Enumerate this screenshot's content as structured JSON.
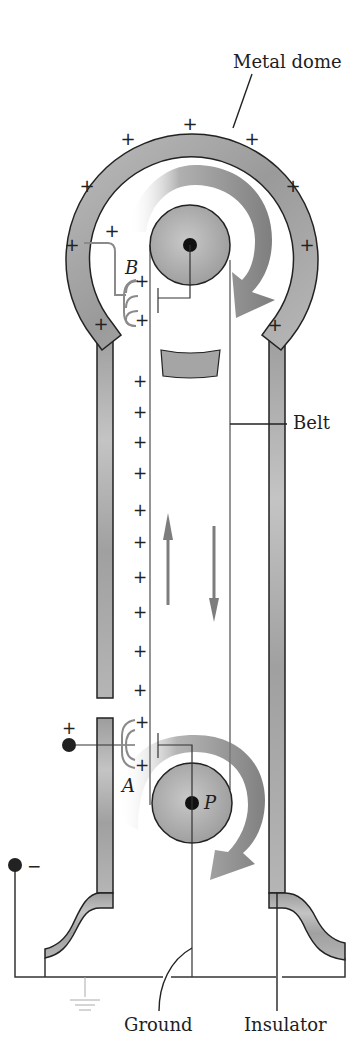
{
  "diagram": {
    "type": "Van de Graaff generator cross-section",
    "labels": {
      "dome": "Metal dome",
      "belt": "Belt",
      "ground": "Ground",
      "insulator": "Insulator",
      "comb_top": "B",
      "comb_bottom": "A",
      "pulley_bottom": "P",
      "source_positive": "+",
      "source_negative": "−",
      "charge": "+"
    },
    "colors": {
      "metal_fill": "#a9a9a9",
      "outline": "#222222",
      "belt_line": "#7a7a7a",
      "arrow_fill": "#8c8c8c",
      "comb": "#8a8a8a"
    },
    "dome_charge_count": 10,
    "belt_charge_count": 14,
    "comb_charge_count": 4
  }
}
